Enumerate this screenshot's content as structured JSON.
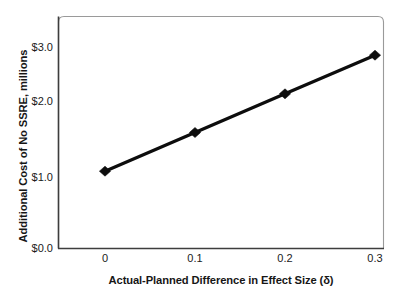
{
  "chart_data": {
    "type": "line",
    "title": "",
    "subtitle": "",
    "xlabel": "Actual-Planned Difference in Effect Size (δ)",
    "ylabel": "Additional Cost of No SSRE, millions",
    "x": [
      0,
      0.1,
      0.2,
      0.3
    ],
    "values": [
      1.0,
      1.5,
      2.0,
      2.5
    ],
    "series": [
      {
        "name": "Additional Cost of No SSRE",
        "values": [
          1.0,
          1.5,
          2.0,
          2.5
        ]
      }
    ],
    "xtick_labels": [
      "0",
      "0.1",
      "0.2",
      "0.3"
    ],
    "xtick_values": [
      0,
      0.1,
      0.2,
      0.3
    ],
    "ytick_labels": [
      "$0.0",
      "$1.0",
      "$2.0",
      "$3.0"
    ],
    "ytick_values": [
      0,
      1,
      2,
      3
    ],
    "xlim": [
      -0.015,
      0.315
    ],
    "ylim": [
      0,
      3
    ],
    "grid": false,
    "legend": false,
    "legend_position": "none",
    "marker": "diamond",
    "line_color": "#0d0d0d",
    "marker_color": "#0d0d0d",
    "plot_background": "#ffffff",
    "frame_color": "#8c8c8c",
    "axis_color": "#3a3a3a"
  },
  "axes": {
    "y_title": "Additional Cost of No SSRE, millions",
    "x_title": "Actual-Planned Difference in Effect Size (δ)",
    "y_ticks": [
      {
        "label": "$3.0",
        "value": 3
      },
      {
        "label": "$2.0",
        "value": 2
      },
      {
        "label": "$1.0",
        "value": 1
      },
      {
        "label": "$0.0",
        "value": 0
      }
    ],
    "x_ticks": [
      {
        "label": "0",
        "value": 0
      },
      {
        "label": "0.1",
        "value": 0.1
      },
      {
        "label": "0.2",
        "value": 0.2
      },
      {
        "label": "0.3",
        "value": 0.3
      }
    ]
  },
  "points": [
    {
      "x": 0,
      "y": 1.0,
      "label": "$1.0"
    },
    {
      "x": 0.1,
      "y": 1.5,
      "label": "$1.5"
    },
    {
      "x": 0.2,
      "y": 2.0,
      "label": "$2.0"
    },
    {
      "x": 0.3,
      "y": 2.5,
      "label": "$2.5"
    }
  ]
}
